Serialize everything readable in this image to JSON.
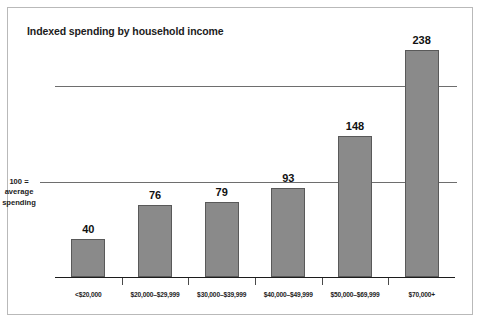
{
  "chart_data": {
    "type": "bar",
    "title": "Indexed spending by household income",
    "xlabel": "",
    "ylabel": "",
    "categories": [
      "<$20,000",
      "$20,000–$29,999",
      "$30,000–$39,999",
      "$40,000–$49,999",
      "$50,000–$69,999",
      "$70,000+"
    ],
    "values": [
      40,
      76,
      79,
      93,
      148,
      238
    ],
    "ylim": [
      0,
      238
    ],
    "grid": true,
    "gridlines": [
      100,
      200
    ],
    "legend": "none",
    "reference_note": {
      "line1": "100 =",
      "line2": "average",
      "line3": "spending",
      "value": 100
    },
    "colors": {
      "bar_fill": "#8a8a8a",
      "bar_stroke": "#595959",
      "gridline": "#6e6e6e",
      "axis": "#1c1c1c",
      "text": "#1c1c1c",
      "border": "#b9b9b9",
      "background": "#ffffff"
    }
  }
}
